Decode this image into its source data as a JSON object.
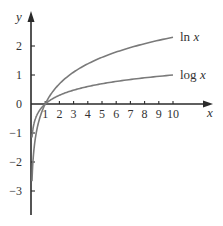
{
  "chart_data": {
    "type": "line",
    "title": "",
    "xlabel": "x",
    "ylabel": "y",
    "xlim": [
      0,
      12.7
    ],
    "ylim": [
      -3.8,
      3.2
    ],
    "grid": false,
    "legend": "inline labels at right end of curves",
    "x_ticks": [
      1,
      2,
      3,
      4,
      5,
      6,
      7,
      8,
      9,
      10
    ],
    "y_ticks": [
      -3,
      -2,
      -1,
      0,
      1,
      2
    ],
    "x_tick_labels": [
      "1",
      "2",
      "3",
      "4",
      "5",
      "6",
      "7",
      "8",
      "9",
      "10"
    ],
    "y_tick_labels": [
      "−3",
      "−2",
      "−1",
      "0",
      "1",
      "2"
    ],
    "series": [
      {
        "name": "ln x",
        "label_text": "ln",
        "label_var": "x",
        "x": [
          0.07,
          0.1,
          0.2,
          0.3,
          0.5,
          0.75,
          1,
          1.5,
          2,
          3,
          4,
          5,
          6,
          7,
          8,
          9,
          10
        ],
        "y": [
          -2.66,
          -2.3,
          -1.61,
          -1.2,
          -0.69,
          -0.29,
          0,
          0.41,
          0.69,
          1.1,
          1.39,
          1.61,
          1.79,
          1.95,
          2.08,
          2.2,
          2.3
        ]
      },
      {
        "name": "log x",
        "label_text": "log",
        "label_var": "x",
        "x": [
          0.07,
          0.1,
          0.2,
          0.3,
          0.5,
          0.75,
          1,
          1.5,
          2,
          3,
          4,
          5,
          6,
          7,
          8,
          9,
          10
        ],
        "y": [
          -1.15,
          -1.0,
          -0.7,
          -0.52,
          -0.3,
          -0.12,
          0,
          0.18,
          0.3,
          0.48,
          0.6,
          0.7,
          0.78,
          0.85,
          0.9,
          0.95,
          1.0
        ]
      }
    ],
    "colors": {
      "axis": "#2a2a2a",
      "curve": "#7a7a7a",
      "text": "#333333"
    }
  }
}
